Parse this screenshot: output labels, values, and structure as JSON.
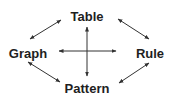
{
  "diagram": {
    "nodes": [
      {
        "id": "table",
        "label": "Table",
        "x": 87,
        "y": 10
      },
      {
        "id": "graph",
        "label": "Graph",
        "x": 28,
        "y": 47
      },
      {
        "id": "rule",
        "label": "Rule",
        "x": 150,
        "y": 47
      },
      {
        "id": "pattern",
        "label": "Pattern",
        "x": 87,
        "y": 82
      }
    ],
    "edges": [
      {
        "from": "graph",
        "to": "table",
        "type": "bidirectional"
      },
      {
        "from": "table",
        "to": "rule",
        "type": "bidirectional"
      },
      {
        "from": "graph",
        "to": "pattern",
        "type": "bidirectional"
      },
      {
        "from": "pattern",
        "to": "rule",
        "type": "bidirectional"
      },
      {
        "from": "table",
        "to": "pattern",
        "type": "bidirectional"
      },
      {
        "from": "graph",
        "to": "rule",
        "type": "bidirectional"
      }
    ],
    "colors": {
      "text": "#1e1e1e",
      "arrow": "#333333",
      "background": "#ffffff"
    }
  }
}
